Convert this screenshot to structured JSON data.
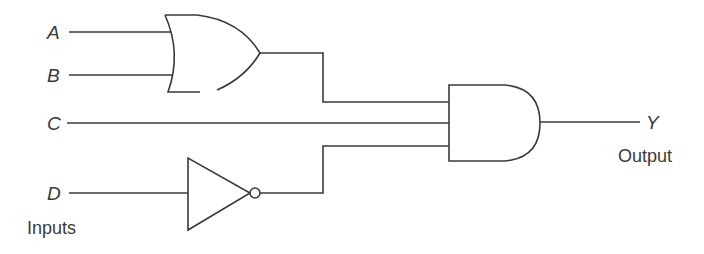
{
  "diagram": {
    "type": "logic-circuit",
    "inputs": [
      {
        "name": "A",
        "label": "A"
      },
      {
        "name": "B",
        "label": "B"
      },
      {
        "name": "C",
        "label": "C"
      },
      {
        "name": "D",
        "label": "D"
      }
    ],
    "inputs_caption": "Inputs",
    "output": {
      "name": "Y",
      "label": "Y"
    },
    "output_caption": "Output",
    "gates": [
      {
        "id": "or1",
        "type": "OR",
        "inputs": [
          "A",
          "B"
        ]
      },
      {
        "id": "not1",
        "type": "NOT",
        "inputs": [
          "D"
        ]
      },
      {
        "id": "and1",
        "type": "AND",
        "inputs": [
          "or1",
          "C",
          "not1"
        ],
        "output": "Y"
      }
    ],
    "expression": "Y = (A + B) · C · D'"
  },
  "colors": {
    "line": "#3a3a3a",
    "background": "#ffffff"
  }
}
